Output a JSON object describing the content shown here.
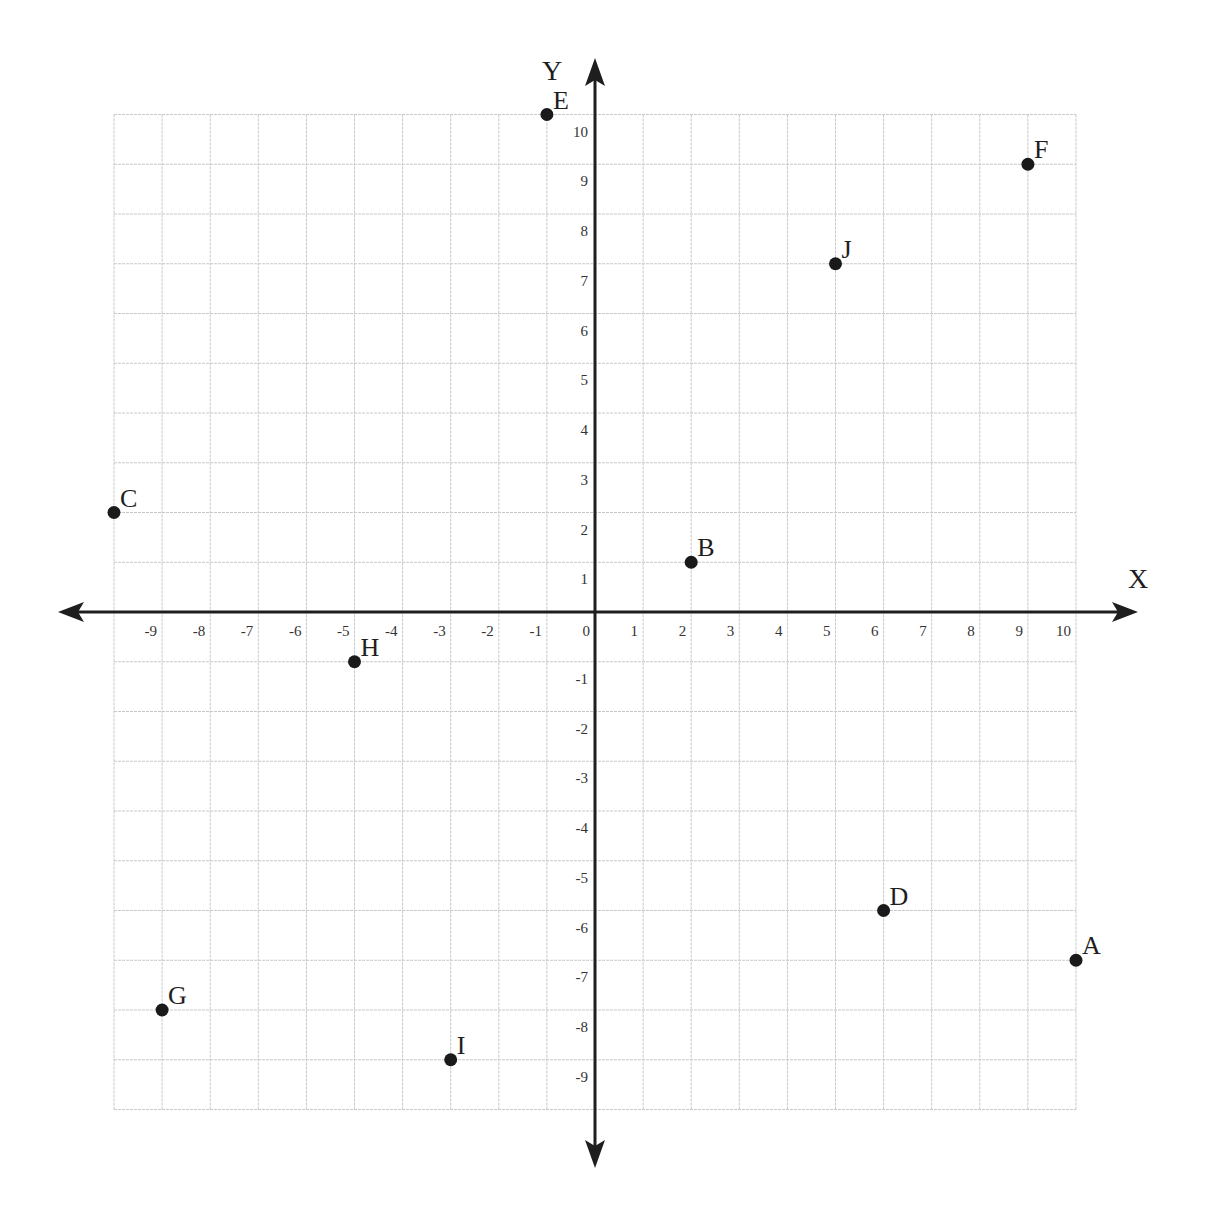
{
  "chart_data": {
    "type": "scatter",
    "title": "",
    "xlabel": "X",
    "ylabel": "Y",
    "xlim": [
      -10,
      10
    ],
    "ylim": [
      -10,
      10
    ],
    "grid": true,
    "x_ticks": [
      -9,
      -8,
      -7,
      -6,
      -5,
      -4,
      -3,
      -2,
      -1,
      0,
      1,
      2,
      3,
      4,
      5,
      6,
      7,
      8,
      9,
      10
    ],
    "y_ticks": [
      10,
      9,
      8,
      7,
      6,
      5,
      4,
      3,
      2,
      1,
      -1,
      -2,
      -3,
      -4,
      -5,
      -6,
      -7,
      -8,
      -9
    ],
    "points": [
      {
        "label": "A",
        "x": 10,
        "y": -7
      },
      {
        "label": "B",
        "x": 2,
        "y": 1
      },
      {
        "label": "C",
        "x": -10,
        "y": 2
      },
      {
        "label": "D",
        "x": 6,
        "y": -6
      },
      {
        "label": "E",
        "x": -1,
        "y": 10
      },
      {
        "label": "F",
        "x": 9,
        "y": 9
      },
      {
        "label": "G",
        "x": -9,
        "y": -8
      },
      {
        "label": "H",
        "x": -5,
        "y": -1
      },
      {
        "label": "I",
        "x": -3,
        "y": -9
      },
      {
        "label": "J",
        "x": 5,
        "y": 7
      }
    ]
  },
  "axes": {
    "x_label": "X",
    "y_label": "Y"
  }
}
